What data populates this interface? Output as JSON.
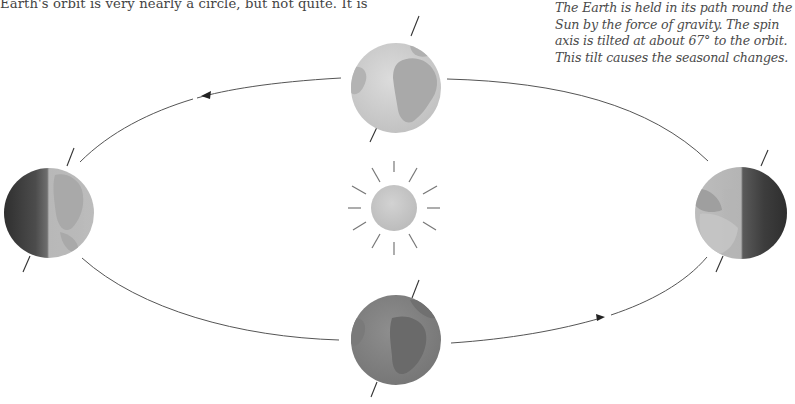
{
  "intro_text": "Earth's orbit is very nearly a circle, but not quite. It is",
  "caption": {
    "lines": [
      "The Earth is held in its path round the",
      "Sun by the force of gravity. The spin",
      "axis is tilted at about 67° to the orbit.",
      "This tilt causes the seasonal changes."
    ]
  },
  "diagram": {
    "sun": {
      "label": "Sun",
      "rays": 12,
      "color": "#c8c8c8"
    },
    "earth_positions": [
      {
        "id": "top",
        "label": "Earth (far side of orbit)",
        "lighting": "fully lit"
      },
      {
        "id": "left",
        "label": "Earth (left)",
        "lighting": "left half dark"
      },
      {
        "id": "right",
        "label": "Earth (right)",
        "lighting": "right half dark"
      },
      {
        "id": "bottom",
        "label": "Earth (near side of orbit)",
        "lighting": "night side facing viewer"
      }
    ],
    "orbit_direction": "counter-clockwise",
    "axis_tilt_degrees": 67
  },
  "colors": {
    "text": "#444444",
    "orbit_line": "#555555",
    "earth_light": "#d4d4d4",
    "earth_land_light": "#a8a8a8",
    "earth_dark": "#3a3a3a",
    "earth_night": "#8a8a8a"
  }
}
